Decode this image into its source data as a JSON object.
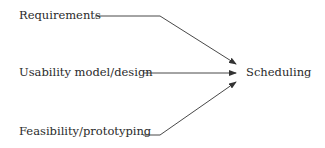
{
  "diagram": {
    "inputs": [
      {
        "label": "Requirements"
      },
      {
        "label": "Usability model/design"
      },
      {
        "label": "Feasibility/prototyping"
      }
    ],
    "output": {
      "label": "Scheduling"
    },
    "colors": {
      "text": "#2a2a2a",
      "line": "#333333",
      "background": "#ffffff"
    }
  }
}
